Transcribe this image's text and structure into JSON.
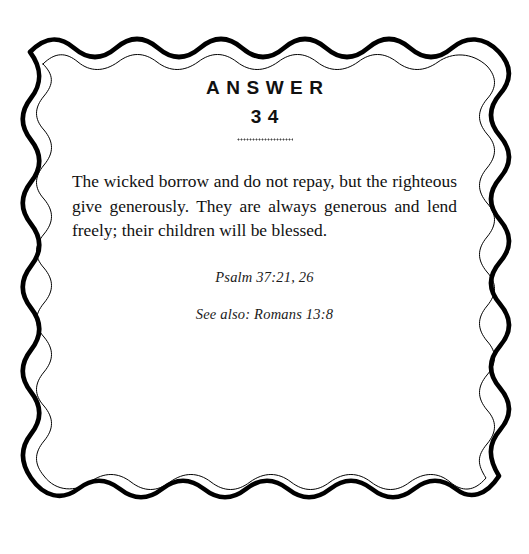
{
  "page": {
    "background_color": "#ffffff",
    "ink_color": "#111111",
    "width": 529,
    "height": 554
  },
  "border": {
    "style": "double-wavy-frame",
    "outer_stroke_color": "#000000",
    "inner_stroke_color": "#000000",
    "outer_stroke_width": 4.6,
    "inner_stroke_width": 1.0
  },
  "header": {
    "label": "ANSWER",
    "number": "34",
    "ornament_name": "dotted-rule"
  },
  "body": {
    "verse_text": "The wicked borrow and do not repay, but the righteous give generously. They are always generous and lend freely; their children will be blessed."
  },
  "citations": {
    "primary": "Psalm 37:21, 26",
    "secondary": "See also: Romans 13:8"
  }
}
